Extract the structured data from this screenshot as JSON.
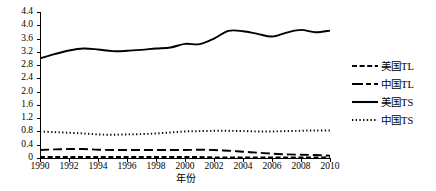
{
  "chart_data": {
    "type": "line",
    "title": "",
    "xlabel": "年份",
    "ylabel": "",
    "xlim": [
      1990,
      2010
    ],
    "ylim": [
      0,
      4.4
    ],
    "grid": false,
    "legend_position": "right",
    "x": [
      1990,
      1991,
      1992,
      1993,
      1994,
      1995,
      1996,
      1997,
      1998,
      1999,
      2000,
      2001,
      2002,
      2003,
      2004,
      2005,
      2006,
      2007,
      2008,
      2009,
      2010
    ],
    "x_tick_labels": [
      "1990",
      "1992",
      "1994",
      "1996",
      "1998",
      "2000",
      "2002",
      "2004",
      "2006",
      "2008",
      "2010"
    ],
    "y_tick_labels": [
      "0",
      "0.4",
      "0.8",
      "1.2",
      "1.6",
      "2.0",
      "2.4",
      "2.8",
      "3.2",
      "3.6",
      "4.0",
      "4.4"
    ],
    "y_tick_values": [
      0,
      0.4,
      0.8,
      1.2,
      1.6,
      2.0,
      2.4,
      2.8,
      3.2,
      3.6,
      4.0,
      4.4
    ],
    "series": [
      {
        "name": "美国TL",
        "style": "dashed",
        "color": "#000000",
        "values": [
          0.03,
          0.03,
          0.03,
          0.03,
          0.03,
          0.03,
          0.03,
          0.03,
          0.03,
          0.03,
          0.03,
          0.03,
          0.02,
          0.02,
          0.02,
          0.02,
          0.02,
          0.02,
          0.02,
          0.02,
          0.02
        ]
      },
      {
        "name": "中国TL",
        "style": "long-dash",
        "color": "#000000",
        "values": [
          0.24,
          0.26,
          0.27,
          0.27,
          0.25,
          0.24,
          0.24,
          0.24,
          0.24,
          0.24,
          0.24,
          0.25,
          0.24,
          0.22,
          0.19,
          0.16,
          0.13,
          0.11,
          0.1,
          0.09,
          0.07
        ]
      },
      {
        "name": "美国TS",
        "style": "solid",
        "color": "#000000",
        "values": [
          3.0,
          3.13,
          3.24,
          3.3,
          3.27,
          3.22,
          3.23,
          3.26,
          3.3,
          3.33,
          3.44,
          3.43,
          3.6,
          3.83,
          3.82,
          3.74,
          3.66,
          3.78,
          3.86,
          3.79,
          3.84
        ]
      },
      {
        "name": "中国TS",
        "style": "dotted",
        "color": "#000000",
        "values": [
          0.8,
          0.78,
          0.76,
          0.74,
          0.71,
          0.7,
          0.71,
          0.72,
          0.74,
          0.77,
          0.8,
          0.81,
          0.82,
          0.82,
          0.81,
          0.8,
          0.8,
          0.81,
          0.82,
          0.83,
          0.83
        ]
      }
    ]
  }
}
